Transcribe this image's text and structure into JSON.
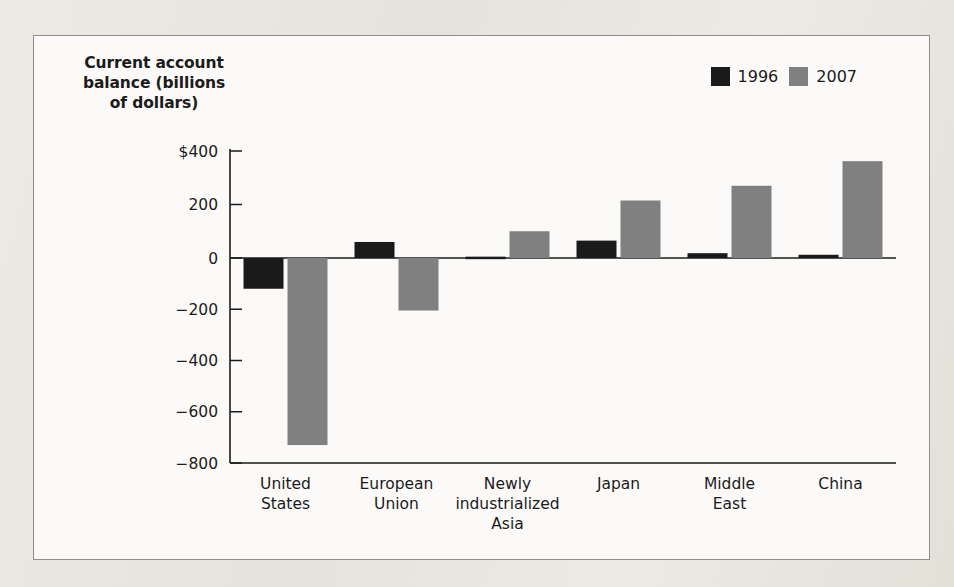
{
  "chart_data": {
    "type": "bar",
    "title": "",
    "xlabel": "",
    "ylabel": "Current account balance (billions of dollars)",
    "ylim": [
      -800,
      400
    ],
    "yticks": [
      400,
      200,
      0,
      -200,
      -400,
      -600,
      -800
    ],
    "ytick_labels": [
      "$400",
      "200",
      "0",
      "−200",
      "−400",
      "−600",
      "−800"
    ],
    "grid": false,
    "legend_position": "top-right",
    "categories": [
      "United\nStates",
      "European\nUnion",
      "Newly\nindustrialized\nAsia",
      "Japan",
      "Middle\nEast",
      "China"
    ],
    "series": [
      {
        "name": "1996",
        "color": "#1a1a1a",
        "values": [
          -120,
          60,
          5,
          65,
          18,
          12
        ]
      },
      {
        "name": "2007",
        "color": "#808080",
        "values": [
          -730,
          -205,
          100,
          215,
          270,
          362
        ]
      }
    ]
  },
  "axis_title_lines": [
    "Current account",
    "balance (billions",
    "of dollars)"
  ],
  "legend": {
    "items": [
      {
        "label": "1996",
        "color": "#1a1a1a",
        "swatch_name": "legend-swatch-1996"
      },
      {
        "label": "2007",
        "color": "#808080",
        "swatch_name": "legend-swatch-2007"
      }
    ]
  },
  "colors": {
    "frame_border": "#8d8d8d",
    "axis_line": "#1b1b1b",
    "plot_background": "#fbfaf8",
    "page_background": "#e9e7e2"
  }
}
